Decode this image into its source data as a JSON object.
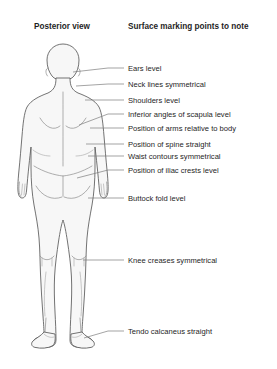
{
  "diagram": {
    "headers": {
      "left": "Posterior view",
      "right": "Surface marking points to note"
    },
    "colors": {
      "background": "#ffffff",
      "body_fill": "#f7f7f7",
      "body_outline": "#5a5a5a",
      "detail_stroke": "#8d8d8d",
      "leader_line": "#7d7d7d",
      "text": "#262626"
    },
    "markings": [
      {
        "label": "Ears level",
        "text_y": 71,
        "leader_y": 68,
        "anchor_x": 73,
        "anchor_y": 72
      },
      {
        "label": "Neck lines symmetrical",
        "text_y": 87,
        "leader_y": 84,
        "anchor_x": 76,
        "anchor_y": 86
      },
      {
        "label": "Shoulders level",
        "text_y": 103,
        "leader_y": 100,
        "anchor_x": 85,
        "anchor_y": 100
      },
      {
        "label": "Inferior angles of scapula level",
        "text_y": 117,
        "leader_y": 114,
        "anchor_x": 79,
        "anchor_y": 125
      },
      {
        "label": "Position of arms relative to body",
        "text_y": 131,
        "leader_y": 128,
        "anchor_x": 90,
        "anchor_y": 128
      },
      {
        "label": "Position of spine straight",
        "text_y": 147,
        "leader_y": 144,
        "anchor_x": 86,
        "anchor_y": 144
      },
      {
        "label": "Waist contours symmetrical",
        "text_y": 159,
        "leader_y": 156,
        "anchor_x": 88,
        "anchor_y": 156
      },
      {
        "label": "Position of iliac crests level",
        "text_y": 173,
        "leader_y": 170,
        "anchor_x": 77,
        "anchor_y": 178
      },
      {
        "label": "Buttock fold level",
        "text_y": 201,
        "leader_y": 198,
        "anchor_x": 88,
        "anchor_y": 198
      },
      {
        "label": "Knee creases symmetral",
        "text_y": 263,
        "leader_y": 260,
        "anchor_x": 83,
        "anchor_y": 260
      },
      {
        "label": "Tendo calcaneus straight",
        "text_y": 334,
        "leader_y": 331,
        "anchor_x": 84,
        "anchor_y": 338
      }
    ],
    "label_overrides": {
      "9": "Knee creases symmetrical"
    },
    "layout": {
      "text_x": 128,
      "leader_start_x": 108,
      "leader_end_x": 124,
      "header_left_x": 34,
      "header_right_x": 128,
      "header_y": 29
    }
  }
}
